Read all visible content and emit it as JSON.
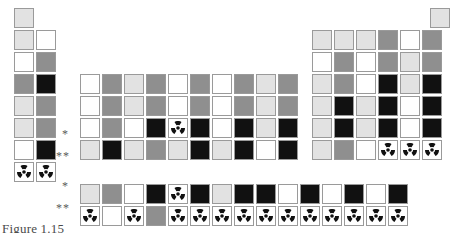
{
  "figure": {
    "caption": "Figure 1.15",
    "caption_clipped": true,
    "width": 459,
    "height": 233,
    "background": "#ffffff",
    "border_color": "#9a9a9a",
    "cell_size": 20,
    "cell_gap": 2,
    "icon": {
      "name": "radioactive-trefoil-icon",
      "color": "#111111"
    }
  },
  "markers": [
    {
      "id": "series-marker-lanthanide-inline",
      "label": "*",
      "x": 62,
      "y": 124
    },
    {
      "id": "series-marker-actinide-inline",
      "label": "**",
      "x": 56,
      "y": 146
    },
    {
      "id": "series-marker-lanthanide-row",
      "label": "*",
      "x": 62,
      "y": 176
    },
    {
      "id": "series-marker-actinide-row",
      "label": "**",
      "x": 56,
      "y": 198
    }
  ],
  "chart_data": {
    "type": "heatmap",
    "title": "Figure 1.15",
    "xlabel": "",
    "ylabel": "",
    "grid": false,
    "legend": "none",
    "shade_palette": {
      "white": "#ffffff",
      "light": "#e2e2e2",
      "mid": "#8f8f8f",
      "dark": "#111111"
    },
    "row_labels": [
      "1",
      "2",
      "3",
      "4",
      "5",
      "6",
      "7",
      "lanthanides",
      "actinides"
    ],
    "rows": [
      {
        "row": 1,
        "y": 8,
        "cells": [
          {
            "x": 14,
            "shade": "light",
            "radioactive": false
          },
          {
            "x": 430,
            "shade": "light",
            "radioactive": false
          }
        ]
      },
      {
        "row": 2,
        "y": 30,
        "cells": [
          {
            "x": 14,
            "shade": "light",
            "radioactive": false
          },
          {
            "x": 36,
            "shade": "white",
            "radioactive": false
          },
          {
            "x": 312,
            "shade": "light",
            "radioactive": false
          },
          {
            "x": 334,
            "shade": "light",
            "radioactive": false
          },
          {
            "x": 356,
            "shade": "light",
            "radioactive": false
          },
          {
            "x": 378,
            "shade": "mid",
            "radioactive": false
          },
          {
            "x": 400,
            "shade": "white",
            "radioactive": false
          },
          {
            "x": 422,
            "shade": "mid",
            "radioactive": false
          }
        ]
      },
      {
        "row": 3,
        "y": 52,
        "cells": [
          {
            "x": 14,
            "shade": "white",
            "radioactive": false
          },
          {
            "x": 36,
            "shade": "mid",
            "radioactive": false
          },
          {
            "x": 312,
            "shade": "white",
            "radioactive": false
          },
          {
            "x": 334,
            "shade": "mid",
            "radioactive": false
          },
          {
            "x": 356,
            "shade": "white",
            "radioactive": false
          },
          {
            "x": 378,
            "shade": "mid",
            "radioactive": false
          },
          {
            "x": 400,
            "shade": "light",
            "radioactive": false
          },
          {
            "x": 422,
            "shade": "mid",
            "radioactive": false
          }
        ]
      },
      {
        "row": 4,
        "y": 74,
        "cells": [
          {
            "x": 14,
            "shade": "mid",
            "radioactive": false
          },
          {
            "x": 36,
            "shade": "dark",
            "radioactive": false
          },
          {
            "x": 80,
            "shade": "white",
            "radioactive": false
          },
          {
            "x": 102,
            "shade": "mid",
            "radioactive": false
          },
          {
            "x": 124,
            "shade": "light",
            "radioactive": false
          },
          {
            "x": 146,
            "shade": "mid",
            "radioactive": false
          },
          {
            "x": 168,
            "shade": "white",
            "radioactive": false
          },
          {
            "x": 190,
            "shade": "mid",
            "radioactive": false
          },
          {
            "x": 212,
            "shade": "white",
            "radioactive": false
          },
          {
            "x": 234,
            "shade": "mid",
            "radioactive": false
          },
          {
            "x": 256,
            "shade": "light",
            "radioactive": false
          },
          {
            "x": 278,
            "shade": "mid",
            "radioactive": false
          },
          {
            "x": 312,
            "shade": "light",
            "radioactive": false
          },
          {
            "x": 334,
            "shade": "mid",
            "radioactive": false
          },
          {
            "x": 356,
            "shade": "white",
            "radioactive": false
          },
          {
            "x": 378,
            "shade": "dark",
            "radioactive": false
          },
          {
            "x": 400,
            "shade": "light",
            "radioactive": false
          },
          {
            "x": 422,
            "shade": "dark",
            "radioactive": false
          }
        ]
      },
      {
        "row": 5,
        "y": 96,
        "cells": [
          {
            "x": 14,
            "shade": "light",
            "radioactive": false
          },
          {
            "x": 36,
            "shade": "mid",
            "radioactive": false
          },
          {
            "x": 80,
            "shade": "white",
            "radioactive": false
          },
          {
            "x": 102,
            "shade": "mid",
            "radioactive": false
          },
          {
            "x": 124,
            "shade": "light",
            "radioactive": false
          },
          {
            "x": 146,
            "shade": "mid",
            "radioactive": false
          },
          {
            "x": 168,
            "shade": "white",
            "radioactive": false
          },
          {
            "x": 190,
            "shade": "mid",
            "radioactive": false
          },
          {
            "x": 212,
            "shade": "white",
            "radioactive": false
          },
          {
            "x": 234,
            "shade": "mid",
            "radioactive": false
          },
          {
            "x": 256,
            "shade": "light",
            "radioactive": false
          },
          {
            "x": 278,
            "shade": "mid",
            "radioactive": false
          },
          {
            "x": 312,
            "shade": "light",
            "radioactive": false
          },
          {
            "x": 334,
            "shade": "dark",
            "radioactive": false
          },
          {
            "x": 356,
            "shade": "light",
            "radioactive": false
          },
          {
            "x": 378,
            "shade": "dark",
            "radioactive": false
          },
          {
            "x": 400,
            "shade": "white",
            "radioactive": false
          },
          {
            "x": 422,
            "shade": "dark",
            "radioactive": false
          }
        ]
      },
      {
        "row": 6,
        "y": 118,
        "cells": [
          {
            "x": 14,
            "shade": "light",
            "radioactive": false
          },
          {
            "x": 36,
            "shade": "mid",
            "radioactive": false
          },
          {
            "x": 80,
            "shade": "white",
            "radioactive": false
          },
          {
            "x": 102,
            "shade": "mid",
            "radioactive": false
          },
          {
            "x": 124,
            "shade": "white",
            "radioactive": false
          },
          {
            "x": 146,
            "shade": "dark",
            "radioactive": false
          },
          {
            "x": 168,
            "shade": "white",
            "radioactive": true
          },
          {
            "x": 190,
            "shade": "dark",
            "radioactive": false
          },
          {
            "x": 212,
            "shade": "white",
            "radioactive": false
          },
          {
            "x": 234,
            "shade": "dark",
            "radioactive": false
          },
          {
            "x": 256,
            "shade": "light",
            "radioactive": false
          },
          {
            "x": 278,
            "shade": "dark",
            "radioactive": false
          },
          {
            "x": 312,
            "shade": "light",
            "radioactive": false
          },
          {
            "x": 334,
            "shade": "dark",
            "radioactive": false
          },
          {
            "x": 356,
            "shade": "light",
            "radioactive": false
          },
          {
            "x": 378,
            "shade": "dark",
            "radioactive": false
          },
          {
            "x": 400,
            "shade": "white",
            "radioactive": false
          },
          {
            "x": 422,
            "shade": "dark",
            "radioactive": false
          }
        ]
      },
      {
        "row": 7,
        "y": 140,
        "cells": [
          {
            "x": 14,
            "shade": "white",
            "radioactive": false
          },
          {
            "x": 36,
            "shade": "dark",
            "radioactive": false
          },
          {
            "x": 80,
            "shade": "light",
            "radioactive": false
          },
          {
            "x": 102,
            "shade": "dark",
            "radioactive": false
          },
          {
            "x": 124,
            "shade": "light",
            "radioactive": false
          },
          {
            "x": 146,
            "shade": "mid",
            "radioactive": false
          },
          {
            "x": 168,
            "shade": "light",
            "radioactive": false
          },
          {
            "x": 190,
            "shade": "dark",
            "radioactive": false
          },
          {
            "x": 212,
            "shade": "light",
            "radioactive": false
          },
          {
            "x": 234,
            "shade": "dark",
            "radioactive": false
          },
          {
            "x": 256,
            "shade": "white",
            "radioactive": false
          },
          {
            "x": 278,
            "shade": "dark",
            "radioactive": false
          },
          {
            "x": 312,
            "shade": "light",
            "radioactive": false
          },
          {
            "x": 334,
            "shade": "mid",
            "radioactive": false
          },
          {
            "x": 356,
            "shade": "white",
            "radioactive": false
          },
          {
            "x": 378,
            "shade": "white",
            "radioactive": true
          },
          {
            "x": 400,
            "shade": "white",
            "radioactive": true
          },
          {
            "x": 422,
            "shade": "white",
            "radioactive": true
          }
        ]
      },
      {
        "row": 8,
        "y": 162,
        "cells": [
          {
            "x": 14,
            "shade": "white",
            "radioactive": true
          },
          {
            "x": 36,
            "shade": "white",
            "radioactive": true
          }
        ]
      },
      {
        "row": 9,
        "series": "lanthanides",
        "y": 184,
        "cells": [
          {
            "x": 80,
            "shade": "light",
            "radioactive": false
          },
          {
            "x": 102,
            "shade": "mid",
            "radioactive": false
          },
          {
            "x": 124,
            "shade": "white",
            "radioactive": false
          },
          {
            "x": 146,
            "shade": "dark",
            "radioactive": false
          },
          {
            "x": 168,
            "shade": "white",
            "radioactive": true
          },
          {
            "x": 190,
            "shade": "dark",
            "radioactive": false
          },
          {
            "x": 212,
            "shade": "light",
            "radioactive": false
          },
          {
            "x": 234,
            "shade": "dark",
            "radioactive": false
          },
          {
            "x": 256,
            "shade": "dark",
            "radioactive": false
          },
          {
            "x": 278,
            "shade": "white",
            "radioactive": false
          },
          {
            "x": 300,
            "shade": "dark",
            "radioactive": false
          },
          {
            "x": 322,
            "shade": "white",
            "radioactive": false
          },
          {
            "x": 344,
            "shade": "dark",
            "radioactive": false
          },
          {
            "x": 366,
            "shade": "white",
            "radioactive": false
          },
          {
            "x": 388,
            "shade": "dark",
            "radioactive": false
          }
        ]
      },
      {
        "row": 10,
        "series": "actinides",
        "y": 206,
        "cells": [
          {
            "x": 80,
            "shade": "white",
            "radioactive": true
          },
          {
            "x": 102,
            "shade": "white",
            "radioactive": false
          },
          {
            "x": 124,
            "shade": "white",
            "radioactive": true
          },
          {
            "x": 146,
            "shade": "mid",
            "radioactive": false
          },
          {
            "x": 168,
            "shade": "white",
            "radioactive": true
          },
          {
            "x": 190,
            "shade": "white",
            "radioactive": true
          },
          {
            "x": 212,
            "shade": "white",
            "radioactive": true
          },
          {
            "x": 234,
            "shade": "white",
            "radioactive": true
          },
          {
            "x": 256,
            "shade": "white",
            "radioactive": true
          },
          {
            "x": 278,
            "shade": "white",
            "radioactive": true
          },
          {
            "x": 300,
            "shade": "white",
            "radioactive": true
          },
          {
            "x": 322,
            "shade": "white",
            "radioactive": true
          },
          {
            "x": 344,
            "shade": "white",
            "radioactive": true
          },
          {
            "x": 366,
            "shade": "white",
            "radioactive": true
          },
          {
            "x": 388,
            "shade": "white",
            "radioactive": true
          }
        ]
      }
    ]
  }
}
